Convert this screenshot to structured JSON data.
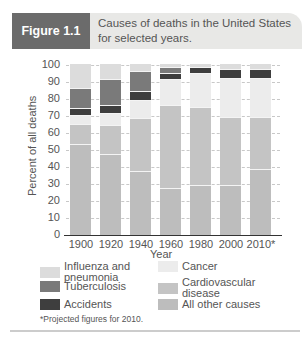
{
  "header": {
    "figure_label": "Figure 1.1",
    "title": "Causes of deaths in the United States for selected years."
  },
  "colors": {
    "Influenza and pneumonia": "#dcdcdc",
    "Tuberculosis": "#7a7a7a",
    "Accidents": "#3e3e3e",
    "Cancer": "#ececec",
    "Cardiovascular disease": "#c4c4c4",
    "All other causes": "#bdbdbd"
  },
  "chart_data": {
    "type": "bar",
    "stacked": true,
    "title": "Causes of deaths in the United States for selected years.",
    "xlabel": "Year",
    "ylabel": "Percent of all deaths",
    "ylim": [
      0,
      100
    ],
    "yticks": [
      0,
      10,
      20,
      30,
      40,
      50,
      60,
      70,
      80,
      90,
      100
    ],
    "grid": true,
    "legend_position": "bottom",
    "categories": [
      "1900",
      "1920",
      "1940",
      "1960",
      "1980",
      "2000",
      "2010*"
    ],
    "series": [
      {
        "name": "All other causes",
        "values": [
          53,
          47,
          37,
          27,
          29,
          29,
          38
        ]
      },
      {
        "name": "Cardiovascular disease",
        "values": [
          12,
          17,
          31,
          49,
          46,
          40,
          31
        ]
      },
      {
        "name": "Cancer",
        "values": [
          5,
          7,
          11,
          15,
          20,
          23,
          23
        ]
      },
      {
        "name": "Accidents",
        "values": [
          4,
          5,
          5,
          4,
          3,
          5,
          5
        ]
      },
      {
        "name": "Tuberculosis",
        "values": [
          12,
          15,
          12,
          3,
          0,
          0,
          0
        ]
      },
      {
        "name": "Influenza and pneumonia",
        "values": [
          14,
          9,
          4,
          2,
          2,
          3,
          3
        ]
      }
    ],
    "footnote": "*Projected figures for 2010."
  },
  "legend": [
    {
      "label": "Influenza and pneumonia",
      "line1": "Influenza and",
      "line2": "pneumonia"
    },
    {
      "label": "Tuberculosis",
      "line1": "Tuberculosis",
      "line2": ""
    },
    {
      "label": "Accidents",
      "line1": "Accidents",
      "line2": ""
    },
    {
      "label": "Cancer",
      "line1": "Cancer",
      "line2": ""
    },
    {
      "label": "Cardiovascular disease",
      "line1": "Cardiovascular",
      "line2": "disease"
    },
    {
      "label": "All other causes",
      "line1": "All other causes",
      "line2": ""
    }
  ]
}
